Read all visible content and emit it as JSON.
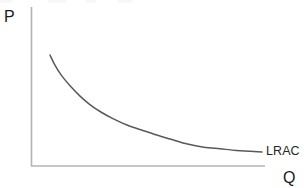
{
  "figure": {
    "background_color": "#ffffff",
    "width": 304,
    "height": 188
  },
  "labels": {
    "y_axis_title": "P",
    "x_axis_title": "Q",
    "curve_label": "LRAC"
  },
  "style": {
    "axis_color": "#b3b3b3",
    "curve_color": "#595959",
    "text_color": "#1a1a1a"
  },
  "chart_data": {
    "type": "line",
    "title": "",
    "xlabel": "Q",
    "ylabel": "P",
    "grid": false,
    "legend": null,
    "axis_ticks": {
      "x": [],
      "y": []
    },
    "xlim": [
      0,
      100
    ],
    "ylim": [
      0,
      100
    ],
    "annotations": [
      {
        "text": "LRAC",
        "x": 100,
        "y": 9,
        "description": "curve label at right end of long-run average cost curve"
      }
    ],
    "series": [
      {
        "name": "LRAC",
        "description": "Long-run average cost curve: steeply falling then flattening (economies of scale then constant returns)",
        "color": "#595959",
        "x": [
          8,
          10,
          13,
          17,
          21,
          25,
          30,
          35,
          41,
          47,
          53,
          60,
          67,
          74,
          81,
          88,
          94,
          99
        ],
        "y": [
          70,
          64,
          57,
          50,
          44,
          39,
          34,
          30,
          26,
          23,
          20,
          17,
          14,
          12,
          11,
          10,
          9.5,
          9
        ]
      }
    ]
  }
}
